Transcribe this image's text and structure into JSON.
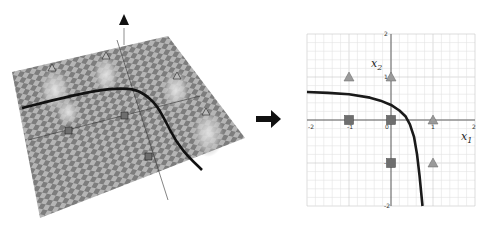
{
  "left_panel": {
    "description": "3D surface over checkerboard plane with decision boundary",
    "up_arrow_icon": "triangle-up"
  },
  "transition_arrow_icon": "arrow-right",
  "chart_data": {
    "type": "scatter",
    "title": "",
    "xlabel": "x1",
    "ylabel": "x2",
    "xlabel_main": "x",
    "xlabel_sub": "1",
    "ylabel_main": "x",
    "ylabel_sub": "2",
    "xlim": [
      -2,
      2
    ],
    "ylim": [
      -2,
      2
    ],
    "grid": true,
    "x_ticks": [
      -2,
      -1,
      0,
      1,
      2
    ],
    "y_ticks": [
      -2,
      -1,
      1,
      2
    ],
    "x_tick_labels": [
      "-2",
      "-1",
      "0",
      "1",
      "2"
    ],
    "y_tick_labels": [
      "-2",
      "-1",
      "1",
      "2"
    ],
    "series": [
      {
        "name": "triangles",
        "marker": "triangle",
        "color": "#9a9a9a",
        "points": [
          [
            -1,
            1
          ],
          [
            0,
            1
          ],
          [
            1,
            0
          ],
          [
            1,
            -1
          ]
        ]
      },
      {
        "name": "squares",
        "marker": "square",
        "color": "#6e6e6e",
        "points": [
          [
            -1,
            0
          ],
          [
            0,
            0
          ],
          [
            0,
            -1
          ]
        ]
      }
    ],
    "boundary": {
      "name": "decision-boundary",
      "color": "#1a1a1a",
      "points": [
        [
          -2,
          0.65
        ],
        [
          -1.5,
          0.63
        ],
        [
          -1,
          0.6
        ],
        [
          -0.5,
          0.52
        ],
        [
          -0.25,
          0.45
        ],
        [
          0,
          0.35
        ],
        [
          0.2,
          0.22
        ],
        [
          0.35,
          0.08
        ],
        [
          0.45,
          -0.1
        ],
        [
          0.55,
          -0.4
        ],
        [
          0.62,
          -0.8
        ],
        [
          0.68,
          -1.3
        ],
        [
          0.72,
          -1.7
        ],
        [
          0.75,
          -2
        ]
      ]
    }
  }
}
